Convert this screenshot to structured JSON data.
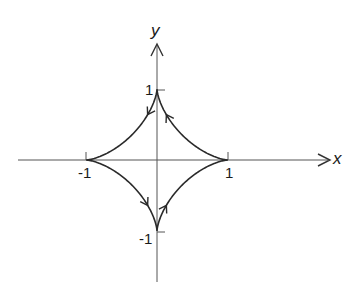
{
  "diagram": {
    "type": "astroid",
    "axes": {
      "x_label": "x",
      "y_label": "y"
    },
    "tick_labels": {
      "x_pos": "1",
      "x_neg": "-1",
      "y_pos": "1",
      "y_neg": "-1"
    },
    "cusps": [
      [
        1,
        0
      ],
      [
        0,
        1
      ],
      [
        -1,
        0
      ],
      [
        0,
        -1
      ]
    ],
    "orientation": "counterclockwise",
    "colors": {
      "curve": "#2a2a2a",
      "axis": "#555555",
      "background": "#ffffff"
    }
  }
}
